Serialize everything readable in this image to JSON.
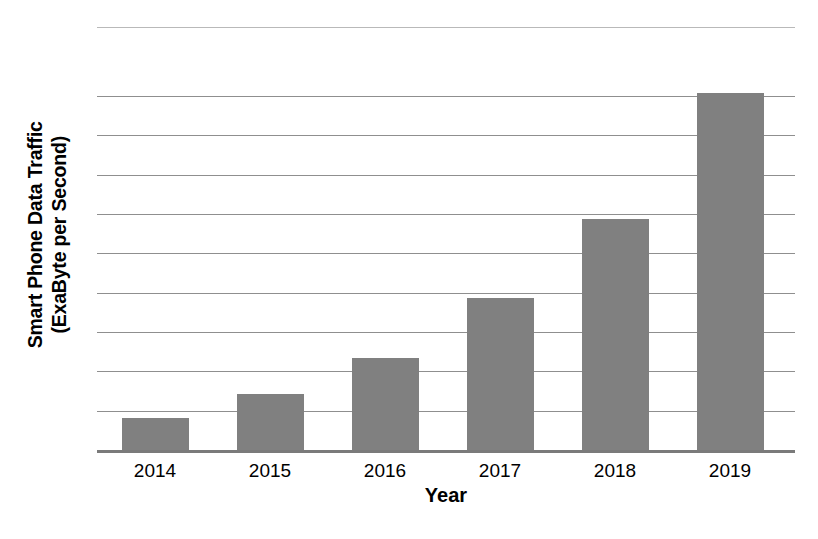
{
  "chart_data": {
    "type": "bar",
    "title": "",
    "subtitle": "",
    "xlabel": "Year",
    "ylabel": "Smart Phone Data Traffic (ExaByte per Second)",
    "ylabel_line1": "Smart Phone Data Traffic",
    "ylabel_line2": "(ExaByte per Second)",
    "categories": [
      "2014",
      "2015",
      "2016",
      "2017",
      "2018",
      "2019"
    ],
    "values": [
      0.83,
      1.44,
      2.37,
      3.89,
      5.91,
      9.09
    ],
    "value_unit": "gridline units (one gridline interval = 1 unit)",
    "ylim": [
      0,
      10.75
    ],
    "y_tick_labels": [],
    "gridlines": {
      "visible": true,
      "count": 9,
      "orientation": "horizontal",
      "color": "#8f8f8f",
      "values": [
        1,
        2,
        3,
        4,
        5,
        6,
        7,
        8,
        9
      ]
    },
    "legend": {
      "visible": false,
      "position": "none",
      "entries": []
    },
    "bar_color": "#808080",
    "bar_edge_color": "#808080",
    "axis_color": "#7a7a7a",
    "background_color": "#ffffff",
    "plot_top_border": true,
    "data_labels_visible": false,
    "y_axis_ticks_visible": false
  },
  "axes": {
    "x_title": "Year",
    "y_title_line1": "Smart Phone Data Traffic",
    "y_title_line2": "(ExaByte per Second)"
  }
}
